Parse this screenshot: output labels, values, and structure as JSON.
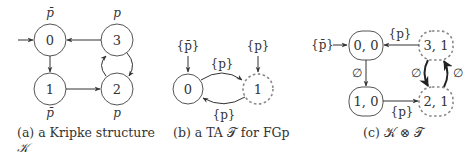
{
  "figure": {
    "panels": [
      {
        "id": "a",
        "caption": {
          "line1": "(a) a Kripke structure",
          "line2": "𝒦"
        },
        "nodes": [
          {
            "id": "0",
            "label": "0",
            "prop": "p̄",
            "initial": true
          },
          {
            "id": "1",
            "label": "1",
            "prop": "p̄"
          },
          {
            "id": "2",
            "label": "2",
            "prop": "p"
          },
          {
            "id": "3",
            "label": "3",
            "prop": "p"
          }
        ],
        "edges": [
          {
            "from": "0",
            "to": "1"
          },
          {
            "from": "1",
            "to": "2"
          },
          {
            "from": "2",
            "to": "3"
          },
          {
            "from": "3",
            "to": "2"
          },
          {
            "from": "3",
            "to": "0"
          }
        ]
      },
      {
        "id": "b",
        "caption": "(b) a TA 𝒯 for FGp",
        "nodes": [
          {
            "id": "0",
            "label": "0",
            "initial_label": "{p̄}",
            "accepting": false
          },
          {
            "id": "1",
            "label": "1",
            "initial_label": "{p}",
            "accepting": true
          }
        ],
        "edges": [
          {
            "from": "0",
            "to": "1",
            "label": "{p}"
          },
          {
            "from": "1",
            "to": "0",
            "label": "{p}"
          }
        ]
      },
      {
        "id": "c",
        "caption": "(c) 𝒦 ⊗ 𝒯",
        "nodes": [
          {
            "id": "0,0",
            "label": "0, 0",
            "initial_label": "{p̄}",
            "accepting": false
          },
          {
            "id": "1,0",
            "label": "1, 0",
            "accepting": false
          },
          {
            "id": "2,1",
            "label": "2, 1",
            "accepting": true
          },
          {
            "id": "3,1",
            "label": "3, 1",
            "accepting": true
          }
        ],
        "edges": [
          {
            "from": "0,0",
            "to": "1,0",
            "label": "∅"
          },
          {
            "from": "1,0",
            "to": "2,1",
            "label": "{p}"
          },
          {
            "from": "3,1",
            "to": "0,0",
            "label": "{p}"
          },
          {
            "from": "3,1",
            "to": "2,1",
            "label": "∅"
          },
          {
            "from": "2,1",
            "to": "3,1",
            "label": "∅"
          }
        ]
      }
    ]
  }
}
